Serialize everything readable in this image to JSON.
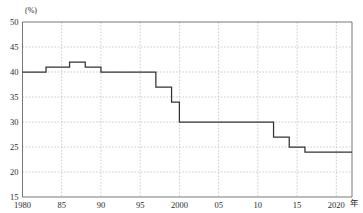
{
  "chart_data": {
    "type": "line",
    "title": "",
    "subtitle": "",
    "xlabel": "年",
    "ylabel": "(%)",
    "unit": "(%)",
    "xlim": [
      1980,
      2022
    ],
    "ylim": [
      15,
      50
    ],
    "ytick_step": 5,
    "grid": true,
    "legend": "none",
    "line_style": "step-post",
    "x_tick_labels": [
      "1980",
      "85",
      "90",
      "95",
      "2000",
      "05",
      "10",
      "15",
      "2020"
    ],
    "x_tick_values": [
      1980,
      1985,
      1990,
      1995,
      2000,
      2005,
      2010,
      2015,
      2020
    ],
    "y_tick_labels": [
      "15",
      "20",
      "25",
      "30",
      "35",
      "40",
      "45",
      "50"
    ],
    "y_tick_values": [
      15,
      20,
      25,
      30,
      35,
      40,
      45,
      50
    ],
    "x": [
      1980,
      1983,
      1984,
      1986,
      1988,
      1990,
      1997,
      1999,
      2000,
      2012,
      2014,
      2016,
      2022
    ],
    "values": [
      40,
      40,
      41,
      42,
      41,
      40,
      37,
      34,
      30,
      30,
      27,
      25,
      24
    ],
    "series": [
      {
        "name": "比率",
        "x": [
          1980,
          1983,
          1984,
          1986,
          1988,
          1990,
          1997,
          1999,
          2000,
          2012,
          2014,
          2016,
          2022
        ],
        "values": [
          40,
          40,
          41,
          42,
          41,
          40,
          37,
          34,
          30,
          30,
          27,
          25,
          24
        ]
      }
    ],
    "steps": [
      {
        "x_start": 1980,
        "x_end": 1983,
        "value": 40
      },
      {
        "x_start": 1983,
        "x_end": 1986,
        "value": 41
      },
      {
        "x_start": 1986,
        "x_end": 1988,
        "value": 42
      },
      {
        "x_start": 1988,
        "x_end": 1990,
        "value": 41
      },
      {
        "x_start": 1990,
        "x_end": 1997,
        "value": 40
      },
      {
        "x_start": 1997,
        "x_end": 1999,
        "value": 37
      },
      {
        "x_start": 1999,
        "x_end": 2000,
        "value": 34
      },
      {
        "x_start": 2000,
        "x_end": 2012,
        "value": 30
      },
      {
        "x_start": 2012,
        "x_end": 2014,
        "value": 27
      },
      {
        "x_start": 2014,
        "x_end": 2016,
        "value": 25
      },
      {
        "x_start": 2016,
        "x_end": 2022,
        "value": 24
      }
    ],
    "colors": {
      "line": "#333333",
      "grid": "#b9b9b9",
      "frame": "#555555",
      "text": "#2b2b2b",
      "background": "#ffffff"
    }
  },
  "axis": {
    "unit_label": "(%)",
    "x_suffix": "年"
  },
  "header": {
    "title": ""
  }
}
